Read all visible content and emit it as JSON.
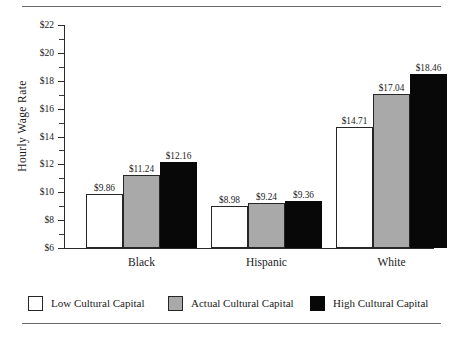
{
  "chart_data": {
    "type": "bar",
    "title": "",
    "xlabel": "",
    "ylabel": "Hourly Wage Rate",
    "ylim": [
      6,
      22
    ],
    "ytick_step": 2,
    "yminor_step": 1,
    "grid": false,
    "legend_position": "bottom",
    "categories": [
      "Black",
      "Hispanic",
      "White"
    ],
    "ytick_labels": [
      "$6",
      "$8",
      "$10",
      "$12",
      "$14",
      "$16",
      "$18",
      "$20",
      "$22"
    ],
    "ytick_values": [
      6,
      8,
      10,
      12,
      14,
      16,
      18,
      20,
      22
    ],
    "yminor_values": [
      7,
      9,
      11,
      13,
      15,
      17,
      19,
      21
    ],
    "series": [
      {
        "name": "Low Cultural Capital",
        "color": "#ffffff",
        "values": [
          9.86,
          9.24,
          14.71
        ],
        "labels": [
          "$9.86",
          "$8.98",
          "$14.71"
        ]
      },
      {
        "name": "Actual Cultural Capital",
        "color": "#a9a9a9",
        "values": [
          11.24,
          9.24,
          17.04
        ],
        "labels": [
          "$11.24",
          "$9.24",
          "$17.04"
        ]
      },
      {
        "name": "High Cultural Capital",
        "color": "#080808",
        "values": [
          12.16,
          9.36,
          18.46
        ],
        "labels": [
          "$12.16",
          "$9.36",
          "$18.46"
        ]
      }
    ],
    "points": [
      {
        "category": "Black",
        "series": "Low Cultural Capital",
        "value": 9.86,
        "label": "$9.86"
      },
      {
        "category": "Black",
        "series": "Actual Cultural Capital",
        "value": 11.24,
        "label": "$11.24"
      },
      {
        "category": "Black",
        "series": "High Cultural Capital",
        "value": 12.16,
        "label": "$12.16"
      },
      {
        "category": "Hispanic",
        "series": "Low Cultural Capital",
        "value": 8.98,
        "label": "$8.98"
      },
      {
        "category": "Hispanic",
        "series": "Actual Cultural Capital",
        "value": 9.24,
        "label": "$9.24"
      },
      {
        "category": "Hispanic",
        "series": "High Cultural Capital",
        "value": 9.36,
        "label": "$9.36"
      },
      {
        "category": "White",
        "series": "Low Cultural Capital",
        "value": 14.71,
        "label": "$14.71"
      },
      {
        "category": "White",
        "series": "Actual Cultural Capital",
        "value": 17.04,
        "label": "$17.04"
      },
      {
        "category": "White",
        "series": "High Cultural Capital",
        "value": 18.46,
        "label": "$18.46"
      }
    ]
  },
  "legend": {
    "items": [
      {
        "label": "Low Cultural Capital",
        "swatch": "low"
      },
      {
        "label": "Actual Cultural Capital",
        "swatch": "actual"
      },
      {
        "label": "High Cultural Capital",
        "swatch": "high"
      }
    ]
  }
}
